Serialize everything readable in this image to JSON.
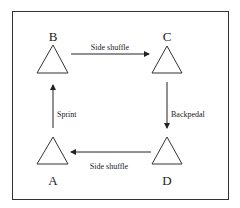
{
  "diagram": {
    "nodes": [
      {
        "id": "A",
        "label": "A"
      },
      {
        "id": "B",
        "label": "B"
      },
      {
        "id": "C",
        "label": "C"
      },
      {
        "id": "D",
        "label": "D"
      }
    ],
    "edges": [
      {
        "from": "B",
        "to": "C",
        "label": "Side shuffle"
      },
      {
        "from": "C",
        "to": "D",
        "label": "Backpedal"
      },
      {
        "from": "D",
        "to": "A",
        "label": "Side shuffle"
      },
      {
        "from": "A",
        "to": "B",
        "label": "Sprint"
      }
    ]
  }
}
